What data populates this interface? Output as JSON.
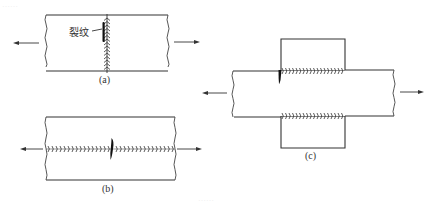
{
  "figure": {
    "top_caption_faint": "……",
    "bottom_caption_faint": "……",
    "panels": [
      {
        "id": "a",
        "label": "(a)",
        "description": "Butt weld across the plate (vertical weld bead), with a crack along the weld; plate pulled left and right",
        "crack_label": "裂纹",
        "force_direction": "horizontal tension"
      },
      {
        "id": "b",
        "label": "(b)",
        "description": "Longitudinal weld along the plate (horizontal weld bead) with a transverse crack; plate pulled left and right",
        "force_direction": "horizontal tension"
      },
      {
        "id": "c",
        "label": "(c)",
        "description": "Lap joint with cover plates above and below; fillet welds along the plate edges, crack at the weld start; main plate pulled left and right",
        "force_direction": "horizontal tension"
      }
    ]
  },
  "colors": {
    "line": "#333333",
    "crack": "#111111",
    "background": "#ffffff"
  }
}
